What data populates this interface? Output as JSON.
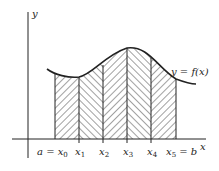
{
  "diagram": {
    "axes": {
      "x_label": "x",
      "y_label": "y"
    },
    "curve_label": "y = f(x)",
    "points": [
      {
        "base": "x",
        "sub": "0",
        "prefix": "a = ",
        "suffix": ""
      },
      {
        "base": "x",
        "sub": "1",
        "prefix": "",
        "suffix": ""
      },
      {
        "base": "x",
        "sub": "2",
        "prefix": "",
        "suffix": ""
      },
      {
        "base": "x",
        "sub": "3",
        "prefix": "",
        "suffix": ""
      },
      {
        "base": "x",
        "sub": "4",
        "prefix": "",
        "suffix": ""
      },
      {
        "base": "x",
        "sub": "5",
        "prefix": "",
        "suffix": " = b"
      }
    ],
    "strips": [
      {
        "from": "x0",
        "to": "x1",
        "hatch": "forward"
      },
      {
        "from": "x1",
        "to": "x2",
        "hatch": "backward"
      },
      {
        "from": "x2",
        "to": "x3",
        "hatch": "forward"
      },
      {
        "from": "x3",
        "to": "x4",
        "hatch": "backward"
      },
      {
        "from": "x4",
        "to": "x5",
        "hatch": "forward"
      }
    ],
    "colors": {
      "stroke": "#222222",
      "hatch": "#444444",
      "background": "#ffffff"
    }
  }
}
